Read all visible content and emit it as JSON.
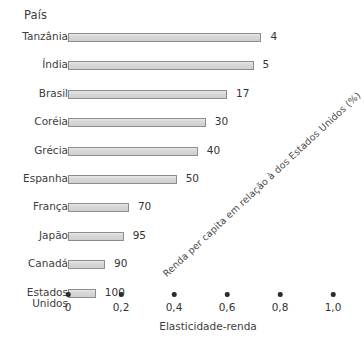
{
  "chart_data": {
    "type": "bar",
    "orientation": "horizontal",
    "title": "",
    "ylabel": "País",
    "xlabel": "Elasticidade-renda",
    "secondary_label": "Renda per capita em relação à dos Estados Unidos (%)",
    "xlim": [
      0,
      1.0
    ],
    "grid": false,
    "legend": null,
    "xticks": [
      {
        "value": 0,
        "label": "0"
      },
      {
        "value": 0.2,
        "label": "0,2"
      },
      {
        "value": 0.4,
        "label": "0,4"
      },
      {
        "value": 0.6,
        "label": "0,6"
      },
      {
        "value": 0.8,
        "label": "0,8"
      },
      {
        "value": 1.0,
        "label": "1,0"
      }
    ],
    "categories": [
      "Tanzânia",
      "Índia",
      "Brasil",
      "Coréia",
      "Grécia",
      "Espanha",
      "França",
      "Japão",
      "Canadá",
      "Estados\nUnidos"
    ],
    "values": [
      0.73,
      0.7,
      0.6,
      0.52,
      0.49,
      0.41,
      0.23,
      0.21,
      0.14,
      0.105
    ],
    "data_labels": [
      "4",
      "5",
      "17",
      "30",
      "40",
      "50",
      "70",
      "95",
      "90",
      "100"
    ],
    "series": [
      {
        "name": "Elasticidade-renda",
        "points": [
          {
            "category": "Tanzânia",
            "elasticidade": 0.73,
            "renda_per_capita_pct": "4"
          },
          {
            "category": "Índia",
            "elasticidade": 0.7,
            "renda_per_capita_pct": "5"
          },
          {
            "category": "Brasil",
            "elasticidade": 0.6,
            "renda_per_capita_pct": "17"
          },
          {
            "category": "Coréia",
            "elasticidade": 0.52,
            "renda_per_capita_pct": "30"
          },
          {
            "category": "Grécia",
            "elasticidade": 0.49,
            "renda_per_capita_pct": "40"
          },
          {
            "category": "Espanha",
            "elasticidade": 0.41,
            "renda_per_capita_pct": "50"
          },
          {
            "category": "França",
            "elasticidade": 0.23,
            "renda_per_capita_pct": "70"
          },
          {
            "category": "Japão",
            "elasticidade": 0.21,
            "renda_per_capita_pct": "95"
          },
          {
            "category": "Canadá",
            "elasticidade": 0.14,
            "renda_per_capita_pct": "90"
          },
          {
            "category": "Estados\nUnidos",
            "elasticidade": 0.105,
            "renda_per_capita_pct": "100"
          }
        ]
      }
    ],
    "colors": {
      "bar_fill": "#d9d9d9",
      "bar_border": "#8d8d8d",
      "text": "#3d3d3d",
      "tick_dot": "#2b2b2b",
      "background": "#ffffff"
    }
  }
}
